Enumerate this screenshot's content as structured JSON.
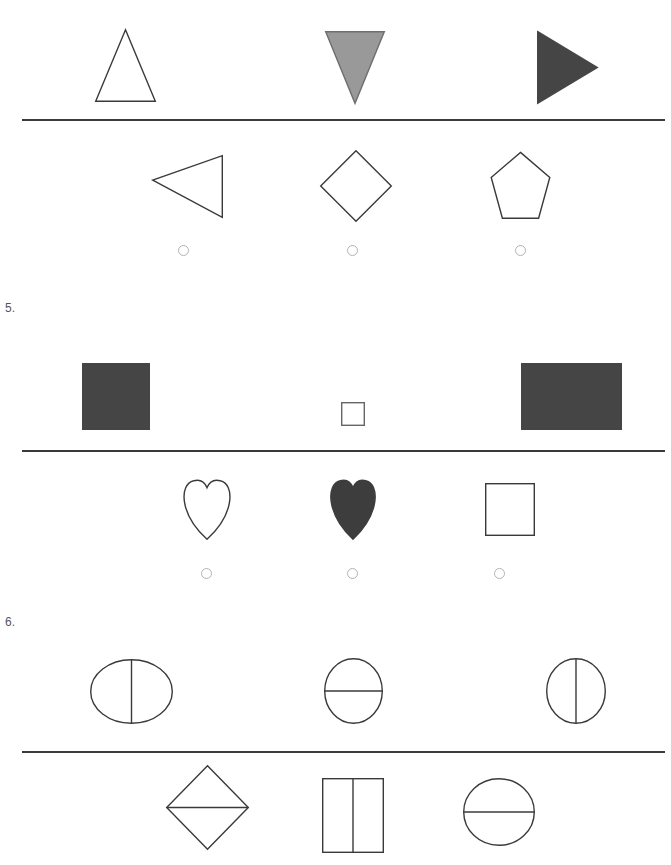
{
  "page": {
    "width": 671,
    "height": 865,
    "background": "#ffffff",
    "kind": "shape-matching-worksheet"
  },
  "colors": {
    "outline": "#3a3a3a",
    "rule": "#3a3a3a",
    "fill_gray": "#999999",
    "fill_dark": "#454545",
    "radio_ring": "#b3b3b3",
    "question_number": "#555555"
  },
  "question_numbers": [
    {
      "label": "5.",
      "x": 5,
      "y": 302
    },
    {
      "label": "6.",
      "x": 5,
      "y": 616
    }
  ],
  "rules": [
    {
      "name": "rule-1",
      "x": 22,
      "y": 119,
      "width": 643
    },
    {
      "name": "rule-2",
      "x": 22,
      "y": 450,
      "width": 643
    },
    {
      "name": "rule-3",
      "x": 22,
      "y": 751,
      "width": 643
    }
  ],
  "rows": [
    {
      "name": "row-1-prompt-triangles",
      "has_radios": false,
      "shapes": [
        {
          "name": "triangle-up-outline",
          "type": "triangle-up",
          "fill": "none",
          "stroke": "#3a3a3a",
          "x": 95,
          "y": 29,
          "width": 61,
          "height": 73
        },
        {
          "name": "triangle-down-gray",
          "type": "triangle-down",
          "fill": "#999999",
          "stroke": "#6e6e6e",
          "x": 325,
          "y": 31,
          "width": 60,
          "height": 73
        },
        {
          "name": "triangle-right-dark",
          "type": "triangle-right",
          "fill": "#454545",
          "stroke": "#454545",
          "x": 537,
          "y": 31,
          "width": 61,
          "height": 73
        }
      ]
    },
    {
      "name": "row-2-options-outline",
      "has_radios": true,
      "shapes": [
        {
          "name": "triangle-left-outline",
          "type": "triangle-left",
          "fill": "none",
          "stroke": "#3a3a3a",
          "x": 152,
          "y": 155,
          "width": 71,
          "height": 63
        },
        {
          "name": "diamond-outline",
          "type": "diamond",
          "fill": "none",
          "stroke": "#3a3a3a",
          "x": 320,
          "y": 150,
          "width": 72,
          "height": 72
        },
        {
          "name": "pentagon-outline",
          "type": "pentagon",
          "fill": "none",
          "stroke": "#3a3a3a",
          "x": 489,
          "y": 153,
          "width": 63,
          "height": 65
        }
      ],
      "radios": [
        {
          "name": "radio-option-1",
          "cx": 183,
          "cy": 250,
          "r": 5.5
        },
        {
          "name": "radio-option-2",
          "cx": 352,
          "cy": 250,
          "r": 5.5
        },
        {
          "name": "radio-option-3",
          "cx": 520,
          "cy": 250,
          "r": 5.5
        }
      ]
    },
    {
      "name": "row-3-prompt-rectangles",
      "has_radios": false,
      "shapes": [
        {
          "name": "square-dark-large",
          "type": "rect",
          "fill": "#454545",
          "stroke": "#454545",
          "x": 82,
          "y": 363,
          "width": 68,
          "height": 67
        },
        {
          "name": "square-small-outline",
          "type": "rect",
          "fill": "none",
          "stroke": "#666666",
          "x": 341,
          "y": 402,
          "width": 24,
          "height": 24
        },
        {
          "name": "rectangle-dark-wide",
          "type": "rect",
          "fill": "#454545",
          "stroke": "#454545",
          "x": 521,
          "y": 363,
          "width": 101,
          "height": 67
        }
      ]
    },
    {
      "name": "row-4-options-hearts",
      "has_radios": true,
      "shapes": [
        {
          "name": "heart-outline",
          "type": "heart",
          "fill": "none",
          "stroke": "#3a3a3a",
          "x": 178,
          "y": 478,
          "width": 58,
          "height": 62
        },
        {
          "name": "heart-dark-filled",
          "type": "heart",
          "fill": "#3d3d3d",
          "stroke": "#3d3d3d",
          "x": 325,
          "y": 478,
          "width": 56,
          "height": 62
        },
        {
          "name": "square-outline",
          "type": "rect",
          "fill": "none",
          "stroke": "#3a3a3a",
          "x": 485,
          "y": 483,
          "width": 50,
          "height": 53
        },
        {
          "name": "radio-row-marker",
          "type": "none",
          "fill": "none",
          "stroke": "none",
          "x": 0,
          "y": 0,
          "width": 0,
          "height": 0
        }
      ],
      "radios": [
        {
          "name": "radio-option-1",
          "cx": 206,
          "cy": 573,
          "r": 5.5
        },
        {
          "name": "radio-option-2",
          "cx": 352,
          "cy": 573,
          "r": 5.5
        },
        {
          "name": "radio-option-3",
          "cx": 499,
          "cy": 573,
          "r": 5.5
        }
      ]
    },
    {
      "name": "row-5-prompt-divided-circles",
      "has_radios": false,
      "shapes": [
        {
          "name": "circle-split-vertical",
          "type": "ellipse-split-vertical",
          "fill": "none",
          "stroke": "#3a3a3a",
          "x": 90,
          "y": 659,
          "width": 83,
          "height": 65
        },
        {
          "name": "circle-split-horizontal",
          "type": "ellipse-split-horizontal",
          "fill": "none",
          "stroke": "#3a3a3a",
          "x": 324,
          "y": 658,
          "width": 59,
          "height": 66
        },
        {
          "name": "oval-split-vertical",
          "type": "ellipse-split-vertical",
          "fill": "none",
          "stroke": "#3a3a3a",
          "x": 546,
          "y": 658,
          "width": 60,
          "height": 66
        }
      ]
    },
    {
      "name": "row-6-options-divided",
      "has_radios": false,
      "shapes": [
        {
          "name": "diamond-split-horizontal",
          "type": "diamond-split-horizontal",
          "fill": "none",
          "stroke": "#3a3a3a",
          "x": 166,
          "y": 765,
          "width": 83,
          "height": 85
        },
        {
          "name": "rectangle-split-vertical",
          "type": "rect-split-vertical",
          "fill": "none",
          "stroke": "#3a3a3a",
          "x": 322,
          "y": 778,
          "width": 62,
          "height": 75
        },
        {
          "name": "circle-split-horizontal",
          "type": "ellipse-split-horizontal",
          "fill": "none",
          "stroke": "#3a3a3a",
          "x": 463,
          "y": 778,
          "width": 72,
          "height": 68
        }
      ]
    }
  ]
}
